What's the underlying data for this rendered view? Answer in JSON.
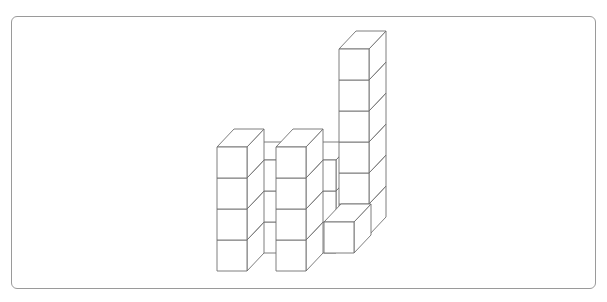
{
  "caption": "",
  "figure": {
    "cube": {
      "w": 30,
      "h": 31,
      "dx": 17,
      "dy": -18
    },
    "stroke_color": "#6f6f6f",
    "frame_color": "#9a9a9a",
    "stacks": [
      {
        "name": "back-column-left",
        "x": 247,
        "y_bottom": 253,
        "count": 3
      },
      {
        "name": "back-column-right",
        "x": 306,
        "y_bottom": 253,
        "count": 3
      },
      {
        "name": "tall-tower",
        "x": 339,
        "y_bottom": 235,
        "count": 6
      },
      {
        "name": "left-tower",
        "x": 217,
        "y_bottom": 271,
        "count": 4
      },
      {
        "name": "middle-tower",
        "x": 276,
        "y_bottom": 271,
        "count": 4
      },
      {
        "name": "front-single-cube",
        "x": 324,
        "y_bottom": 253,
        "count": 1
      }
    ],
    "total_cubes": 21
  }
}
